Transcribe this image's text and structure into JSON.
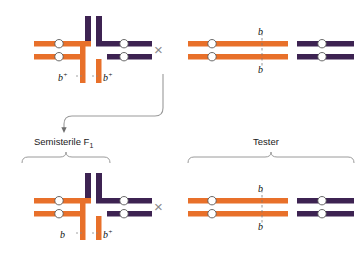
{
  "figure": {
    "colors": {
      "orange": "#E8702A",
      "orange_dark": "#C4551B",
      "purple": "#3D2352",
      "purple_light": "#5A3D70",
      "centromere_fill": "#FFFFFF",
      "text": "#1a1a1a",
      "cross_symbol": "#8a8a8a",
      "arrow": "#6e6e6e",
      "bracket": "#9a9a9a",
      "dashed_line": "#7a7a7a"
    }
  },
  "cross_symbols": {
    "top": "×",
    "bottom": "×"
  },
  "top_row": {
    "left_parent": {
      "name": "translocation-heterozygote-parent",
      "description": "Cross-shaped translocation configuration",
      "alleles": [
        {
          "base": "b",
          "sup": "+",
          "position": "left"
        },
        {
          "base": "b",
          "sup": "+",
          "position": "right"
        }
      ]
    },
    "right_parent": {
      "name": "tester-parent",
      "description": "Normal homologous chromosomes",
      "alleles": [
        {
          "base": "b",
          "sup": "",
          "position": "top"
        },
        {
          "base": "b",
          "sup": "",
          "position": "bottom"
        }
      ]
    }
  },
  "generation_labels": {
    "f1": {
      "text": "Semisterile F",
      "subscript": "1"
    },
    "tester": {
      "text": "Tester",
      "subscript": ""
    }
  },
  "bottom_row": {
    "left_parent": {
      "name": "semisterile-f1",
      "description": "Cross-shaped translocation configuration in F1",
      "alleles": [
        {
          "base": "b",
          "sup": "",
          "position": "left"
        },
        {
          "base": "b",
          "sup": "+",
          "position": "right"
        }
      ]
    },
    "right_parent": {
      "name": "tester-parent",
      "description": "Normal homologous chromosomes",
      "alleles": [
        {
          "base": "b",
          "sup": "",
          "position": "top"
        },
        {
          "base": "b",
          "sup": "",
          "position": "bottom"
        }
      ]
    }
  }
}
